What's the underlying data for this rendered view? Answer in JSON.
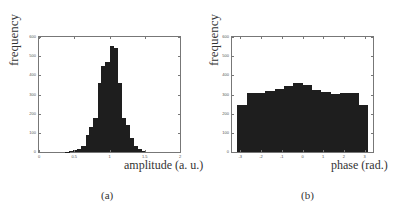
{
  "chart_data": [
    {
      "type": "bar",
      "title": "",
      "panel_label": "(a)",
      "xlabel": "amplitude (a. u.)",
      "ylabel": "frequency",
      "xlim": [
        0,
        2
      ],
      "ylim": [
        0,
        600
      ],
      "xticks": [
        "0",
        "0.5",
        "1",
        "1.5",
        "2"
      ],
      "yticks": [
        "0",
        "100",
        "200",
        "300",
        "400",
        "500",
        "600"
      ],
      "grid": false,
      "bin_width": 0.057,
      "x": [
        0.4,
        0.46,
        0.51,
        0.57,
        0.63,
        0.69,
        0.74,
        0.8,
        0.86,
        0.91,
        0.97,
        1.03,
        1.09,
        1.14,
        1.2,
        1.26,
        1.31,
        1.37,
        1.43,
        1.49
      ],
      "values": [
        2,
        4,
        8,
        15,
        32,
        88,
        128,
        180,
        362,
        450,
        470,
        553,
        543,
        362,
        180,
        140,
        72,
        32,
        15,
        4
      ]
    },
    {
      "type": "bar",
      "title": "",
      "panel_label": "(b)",
      "xlabel": "phase (rad.)",
      "ylabel": "frequency",
      "xlim": [
        -3.4,
        3.4
      ],
      "ylim": [
        0,
        600
      ],
      "xticks": [
        "-3",
        "-2",
        "-1",
        "0",
        "1",
        "2",
        "3"
      ],
      "yticks": [
        "0",
        "100",
        "200",
        "300",
        "400",
        "500",
        "600"
      ],
      "grid": false,
      "bin_width": 0.449,
      "x": [
        -2.92,
        -2.47,
        -2.02,
        -1.57,
        -1.12,
        -0.67,
        -0.22,
        0.22,
        0.67,
        1.12,
        1.57,
        2.02,
        2.47,
        2.92
      ],
      "values": [
        245,
        310,
        310,
        320,
        330,
        345,
        360,
        350,
        325,
        315,
        305,
        310,
        310,
        245
      ]
    }
  ],
  "labels": {
    "a_ylabel": "frequency",
    "a_xlabel": "amplitude (a. u.)",
    "a_caption": "(a)",
    "b_ylabel": "frequency",
    "b_xlabel": "phase (rad.)",
    "b_caption": "(b)"
  }
}
